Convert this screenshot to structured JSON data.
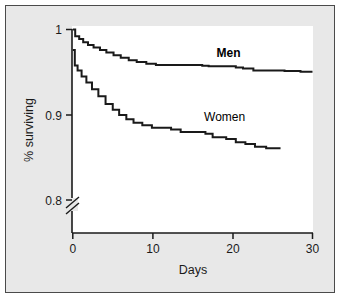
{
  "figure": {
    "background_color": "#e8e8e8",
    "panel_color": "#ffffff",
    "border_color": "#4a4a4a",
    "line_color": "#1a1a1a"
  },
  "chart_data": {
    "type": "line",
    "subtype": "step",
    "title": "",
    "xlabel": "Days",
    "ylabel": "% surviving",
    "xlim": [
      0,
      30
    ],
    "ylim": [
      0.8,
      1.0
    ],
    "xticks": [
      0,
      10,
      20,
      30
    ],
    "xtick_labels": [
      "0",
      "10",
      "20",
      "30"
    ],
    "yticks": [
      0.8,
      0.9,
      1.0
    ],
    "ytick_labels": [
      "0.8",
      "0.9",
      "1"
    ],
    "grid": false,
    "legend_position": "inline-annotation",
    "axis_break": {
      "axis": "y",
      "below_value": 0.8,
      "style": "double-slash",
      "origin_label": "0"
    },
    "annotations": [
      {
        "text": "Men",
        "x": 19.5,
        "y": 0.968,
        "bold": true
      },
      {
        "text": "Women",
        "x": 19.0,
        "y": 0.893,
        "bold": false
      }
    ],
    "series": [
      {
        "name": "Men",
        "label": "Men",
        "bold_label": true,
        "points": [
          [
            0.0,
            1.0
          ],
          [
            0.3,
            0.992
          ],
          [
            0.8,
            0.989
          ],
          [
            1.3,
            0.985
          ],
          [
            1.9,
            0.982
          ],
          [
            2.6,
            0.979
          ],
          [
            3.4,
            0.976
          ],
          [
            4.2,
            0.973
          ],
          [
            5.1,
            0.97
          ],
          [
            6.0,
            0.967
          ],
          [
            7.0,
            0.964
          ],
          [
            8.0,
            0.962
          ],
          [
            9.2,
            0.96
          ],
          [
            10.4,
            0.9585
          ],
          [
            16.2,
            0.9575
          ],
          [
            17.0,
            0.957
          ],
          [
            20.4,
            0.9555
          ],
          [
            21.3,
            0.9545
          ],
          [
            22.6,
            0.952
          ],
          [
            26.5,
            0.9515
          ],
          [
            28.5,
            0.9505
          ],
          [
            30.0,
            0.9505
          ]
        ]
      },
      {
        "name": "Women",
        "label": "Women",
        "bold_label": false,
        "points": [
          [
            0.0,
            0.976
          ],
          [
            0.25,
            0.958
          ],
          [
            0.6,
            0.952
          ],
          [
            1.1,
            0.945
          ],
          [
            1.7,
            0.938
          ],
          [
            2.4,
            0.93
          ],
          [
            3.2,
            0.922
          ],
          [
            4.1,
            0.913
          ],
          [
            5.0,
            0.906
          ],
          [
            5.8,
            0.9
          ],
          [
            6.7,
            0.895
          ],
          [
            7.6,
            0.891
          ],
          [
            8.7,
            0.888
          ],
          [
            9.9,
            0.885
          ],
          [
            12.3,
            0.883
          ],
          [
            13.5,
            0.88
          ],
          [
            16.6,
            0.878
          ],
          [
            17.5,
            0.874
          ],
          [
            19.2,
            0.872
          ],
          [
            20.4,
            0.868
          ],
          [
            21.6,
            0.866
          ],
          [
            22.8,
            0.863
          ],
          [
            24.2,
            0.861
          ],
          [
            26.0,
            0.861
          ]
        ]
      }
    ]
  }
}
